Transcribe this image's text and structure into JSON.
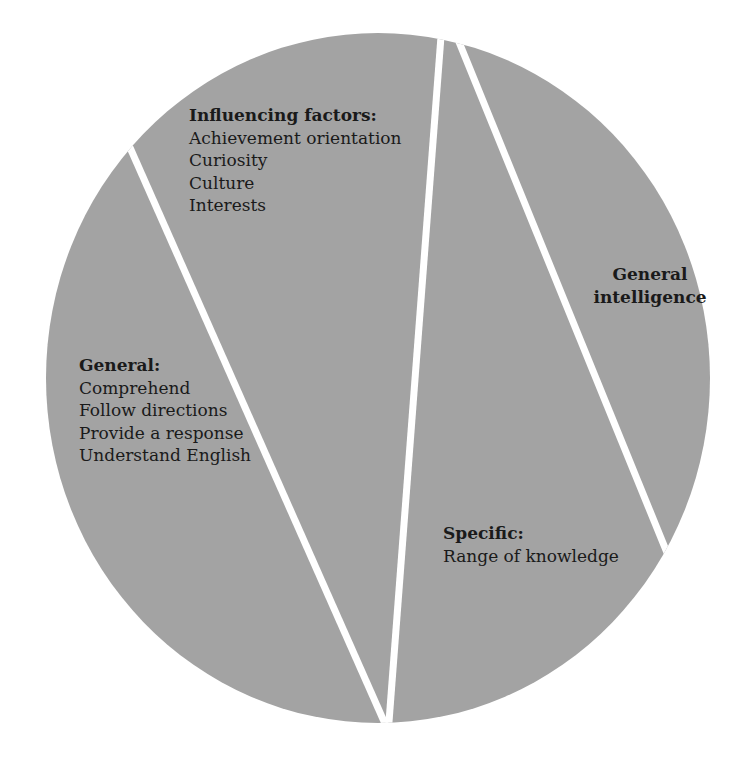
{
  "colors": {
    "fill": "#a3a3a3",
    "divider": "#ffffff",
    "background": "#ffffff",
    "text": "#1a1a1a"
  },
  "diagram": {
    "shape": "circle divided into four slices",
    "sections": [
      {
        "id": "general",
        "heading": "General:",
        "items": [
          "Comprehend",
          "Follow directions",
          "Provide a response",
          "Understand English"
        ]
      },
      {
        "id": "influencing-factors",
        "heading": "Influencing factors:",
        "items": [
          "Achievement orientation",
          "Curiosity",
          "Culture",
          "Interests"
        ]
      },
      {
        "id": "specific",
        "heading": "Specific:",
        "items": [
          "Range of knowledge"
        ]
      },
      {
        "id": "general-intelligence",
        "heading_lines": [
          "General",
          "intelligence"
        ]
      }
    ]
  }
}
